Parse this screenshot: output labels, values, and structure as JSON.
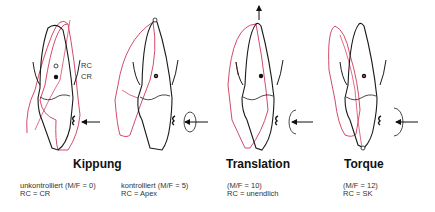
{
  "colors": {
    "original_outline": "#1a1a1a",
    "displaced_outline": "#d44a6a"
  },
  "labels": {
    "rc": "RC",
    "cr": "CR"
  },
  "panels": [
    {
      "id": "kippung-unkontrolliert",
      "line1": "unkontrolliert (M/F = 0)",
      "line2": "RC = CR"
    },
    {
      "id": "kippung-kontrolliert",
      "line1": "kontrolliert (M/F = 5)",
      "line2": "RC = Apex"
    },
    {
      "id": "translation",
      "line1": "(M/F = 10)",
      "line2": "RC = unendlich"
    },
    {
      "id": "torque",
      "line1": "(M/F = 12)",
      "line2": "RC = SK"
    }
  ],
  "titles": {
    "kippung": "Kippung",
    "translation": "Translation",
    "torque": "Torque"
  }
}
